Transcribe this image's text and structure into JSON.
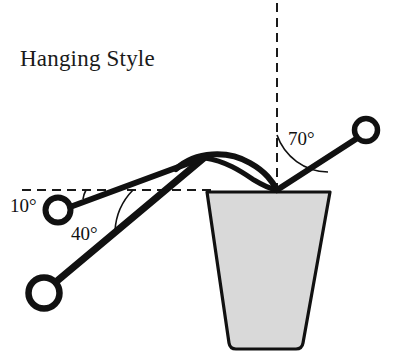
{
  "figure": {
    "title": "Hanging Style",
    "background_color": "#ffffff",
    "ink_color": "#111111",
    "pot_fill_color": "#d9d9d9"
  },
  "labels": [
    {
      "id": "angle-10",
      "text": "10°",
      "x": 10,
      "y": 212,
      "value": 10,
      "unit": "degrees"
    },
    {
      "id": "angle-40",
      "text": "40°",
      "x": 71,
      "y": 240,
      "value": 40,
      "unit": "degrees"
    },
    {
      "id": "angle-70",
      "text": "70°",
      "x": 288,
      "y": 145,
      "value": 70,
      "unit": "degrees"
    }
  ],
  "guides": {
    "horizontal_dashed": {
      "x1": 22,
      "y1": 190,
      "x2": 212,
      "y2": 190
    },
    "vertical_dashed": {
      "x1": 277,
      "y1": 3,
      "x2": 277,
      "y2": 190
    }
  },
  "pivot": {
    "x": 277,
    "y": 190
  },
  "rings": [
    {
      "id": "ring-left-upper",
      "cx": 58,
      "cy": 210,
      "r": 12.5,
      "stroke_width": 6
    },
    {
      "id": "ring-left-lower",
      "cx": 44,
      "cy": 293,
      "r": 15.5,
      "stroke_width": 6.5
    },
    {
      "id": "ring-right",
      "cx": 366,
      "cy": 130,
      "r": 11.5,
      "stroke_width": 5.5
    }
  ],
  "rods": [
    {
      "id": "rod-10deg",
      "x1": 70,
      "y1": 207,
      "x2": 200,
      "y2": 159,
      "stroke_width": 6,
      "angle_deg": 10
    },
    {
      "id": "rod-40deg",
      "x1": 57,
      "y1": 281,
      "x2": 205,
      "y2": 157,
      "stroke_width": 7,
      "angle_deg": 40
    },
    {
      "id": "rod-70deg",
      "x1": 277,
      "y1": 190,
      "x2": 356,
      "y2": 139,
      "stroke_width": 6,
      "angle_deg": 70
    }
  ],
  "curves": [
    {
      "id": "hook-outer-arc",
      "path": "M 176,169 C 196,151 228,150 250,163 C 266,172 272,181 277,190",
      "stroke_width": 6
    },
    {
      "id": "hook-inner-arc",
      "path": "M 205,158 C 226,161 242,172 254,180 C 264,186 271,189 277,190",
      "stroke_width": 5
    }
  ],
  "pot": {
    "id": "hanging-pot",
    "path": "M 207,192 L 229,343 Q 230,349 236,349 L 296,349 Q 302,349 303,343 L 330,192 Z",
    "rim": {
      "left_x": 207,
      "right_x": 330,
      "y": 192
    },
    "base": {
      "left_x": 229,
      "right_x": 303,
      "y": 349
    }
  },
  "angle_arcs": [
    {
      "id": "arc-10",
      "path": "M 86,190 A 28 28 0 0 0 83,199",
      "for_label": "10°"
    },
    {
      "id": "arc-40",
      "path": "M 133,190 A 63 63 0 0 0 115,231",
      "for_label": "40°"
    },
    {
      "id": "arc-70",
      "path": "M 277,135 A 55 55 0 0 0 328,172",
      "for_label": "70°"
    }
  ]
}
